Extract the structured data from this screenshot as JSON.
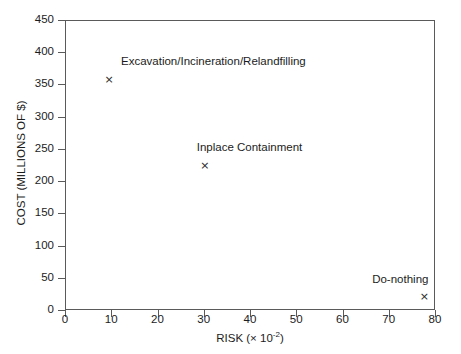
{
  "chart_data": {
    "type": "scatter",
    "title": "",
    "xlabel": "RISK (× 10⁻²)",
    "xlabel_base": "RISK (× 10",
    "xlabel_exp": "-2",
    "xlabel_close": ")",
    "ylabel": "COST (MILLIONS OF $)",
    "xlim": [
      0,
      80
    ],
    "ylim": [
      0,
      450
    ],
    "xticks": [
      0,
      10,
      20,
      30,
      40,
      50,
      60,
      70,
      80
    ],
    "yticks": [
      0,
      50,
      100,
      150,
      200,
      250,
      300,
      350,
      400,
      450
    ],
    "xtick_labels": [
      "0",
      "10",
      "20",
      "30",
      "40",
      "50",
      "60",
      "70",
      "80"
    ],
    "ytick_labels": [
      "0",
      "50",
      "100",
      "150",
      "200",
      "250",
      "300",
      "350",
      "400",
      "450"
    ],
    "grid": false,
    "legend": "none",
    "marker": "x",
    "marker_color": "#2a2a2a",
    "axis_color": "#5a5a5a",
    "background": "#ffffff",
    "points": [
      {
        "label": "Excavation/Incineration/Relandfilling",
        "x": 9.3,
        "y": 360,
        "label_dx": 12,
        "label_dy": -24,
        "label_align": "left"
      },
      {
        "label": "Inplace Containment",
        "x": 30.0,
        "y": 226,
        "label_dx": -8,
        "label_dy": -24,
        "label_align": "left"
      },
      {
        "label": "Do-nothing",
        "x": 77.5,
        "y": 22,
        "label_dx": 4,
        "label_dy": -24,
        "label_align": "right"
      }
    ]
  }
}
